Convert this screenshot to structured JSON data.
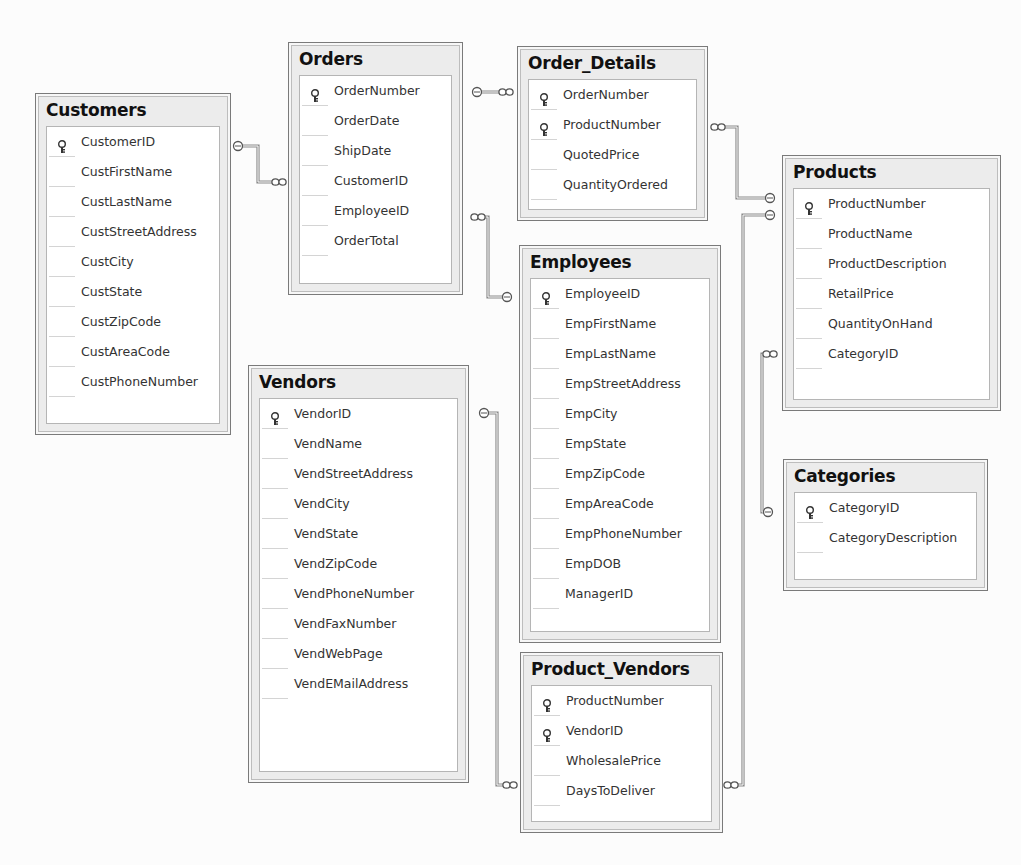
{
  "diagram": {
    "tables": [
      {
        "id": "customers",
        "name": "Customers",
        "fields": [
          {
            "name": "CustomerID",
            "key": true
          },
          {
            "name": "CustFirstName",
            "key": false
          },
          {
            "name": "CustLastName",
            "key": false
          },
          {
            "name": "CustStreetAddress",
            "key": false
          },
          {
            "name": "CustCity",
            "key": false
          },
          {
            "name": "CustState",
            "key": false
          },
          {
            "name": "CustZipCode",
            "key": false
          },
          {
            "name": "CustAreaCode",
            "key": false
          },
          {
            "name": "CustPhoneNumber",
            "key": false
          }
        ]
      },
      {
        "id": "orders",
        "name": "Orders",
        "fields": [
          {
            "name": "OrderNumber",
            "key": true
          },
          {
            "name": "OrderDate",
            "key": false
          },
          {
            "name": "ShipDate",
            "key": false
          },
          {
            "name": "CustomerID",
            "key": false
          },
          {
            "name": "EmployeeID",
            "key": false
          },
          {
            "name": "OrderTotal",
            "key": false
          }
        ]
      },
      {
        "id": "order-details",
        "name": "Order_Details",
        "fields": [
          {
            "name": "OrderNumber",
            "key": true
          },
          {
            "name": "ProductNumber",
            "key": true
          },
          {
            "name": "QuotedPrice",
            "key": false
          },
          {
            "name": "QuantityOrdered",
            "key": false
          }
        ]
      },
      {
        "id": "products",
        "name": "Products",
        "fields": [
          {
            "name": "ProductNumber",
            "key": true
          },
          {
            "name": "ProductName",
            "key": false
          },
          {
            "name": "ProductDescription",
            "key": false
          },
          {
            "name": "RetailPrice",
            "key": false
          },
          {
            "name": "QuantityOnHand",
            "key": false
          },
          {
            "name": "CategoryID",
            "key": false
          }
        ]
      },
      {
        "id": "employees",
        "name": "Employees",
        "fields": [
          {
            "name": "EmployeeID",
            "key": true
          },
          {
            "name": "EmpFirstName",
            "key": false
          },
          {
            "name": "EmpLastName",
            "key": false
          },
          {
            "name": "EmpStreetAddress",
            "key": false
          },
          {
            "name": "EmpCity",
            "key": false
          },
          {
            "name": "EmpState",
            "key": false
          },
          {
            "name": "EmpZipCode",
            "key": false
          },
          {
            "name": "EmpAreaCode",
            "key": false
          },
          {
            "name": "EmpPhoneNumber",
            "key": false
          },
          {
            "name": "EmpDOB",
            "key": false
          },
          {
            "name": "ManagerID",
            "key": false
          }
        ]
      },
      {
        "id": "vendors",
        "name": "Vendors",
        "fields": [
          {
            "name": "VendorID",
            "key": true
          },
          {
            "name": "VendName",
            "key": false
          },
          {
            "name": "VendStreetAddress",
            "key": false
          },
          {
            "name": "VendCity",
            "key": false
          },
          {
            "name": "VendState",
            "key": false
          },
          {
            "name": "VendZipCode",
            "key": false
          },
          {
            "name": "VendPhoneNumber",
            "key": false
          },
          {
            "name": "VendFaxNumber",
            "key": false
          },
          {
            "name": "VendWebPage",
            "key": false
          },
          {
            "name": "VendEMailAddress",
            "key": false
          }
        ]
      },
      {
        "id": "categories",
        "name": "Categories",
        "fields": [
          {
            "name": "CategoryID",
            "key": true
          },
          {
            "name": "CategoryDescription",
            "key": false
          }
        ]
      },
      {
        "id": "product-vendors",
        "name": "Product_Vendors",
        "fields": [
          {
            "name": "ProductNumber",
            "key": true
          },
          {
            "name": "VendorID",
            "key": true
          },
          {
            "name": "WholesalePrice",
            "key": false
          },
          {
            "name": "DaysToDeliver",
            "key": false
          }
        ]
      }
    ],
    "relationships": [
      {
        "one": "Customers",
        "many": "Orders"
      },
      {
        "one": "Orders",
        "many": "Order_Details"
      },
      {
        "one": "Employees",
        "many": "Orders"
      },
      {
        "one": "Products",
        "many": "Order_Details"
      },
      {
        "one": "Products",
        "many": "Product_Vendors"
      },
      {
        "one": "Categories",
        "many": "Products"
      },
      {
        "one": "Vendors",
        "many": "Product_Vendors"
      }
    ]
  }
}
